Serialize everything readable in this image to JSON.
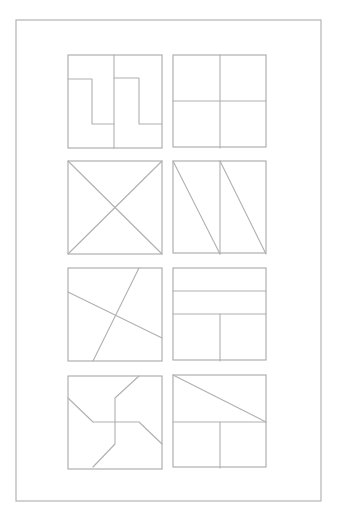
{
  "page": {
    "frame": {
      "x": 16,
      "y": 20,
      "w": 305,
      "h": 481
    },
    "line_color": "#aaaaaa"
  },
  "squares": [
    {
      "id": 1,
      "name": "two-step-shapes",
      "x": 68,
      "y": 55,
      "size": 94,
      "lines": [
        "M114,55 L114,148",
        "M68,79 L92,79 L92,124 L114,124",
        "M114,78 L139,78 L139,124 L162,124"
      ]
    },
    {
      "id": 2,
      "name": "four-quadrants",
      "x": 173,
      "y": 55,
      "size": 93,
      "lines": [
        "M220,55 L220,148",
        "M173,101 L266,101"
      ]
    },
    {
      "id": 3,
      "name": "diagonal-cross",
      "x": 68,
      "y": 161,
      "size": 94,
      "lines": [
        "M68,161 L162,254",
        "M162,161 L68,254"
      ]
    },
    {
      "id": 4,
      "name": "two-halves-diagonals",
      "x": 173,
      "y": 161,
      "size": 93,
      "lines": [
        "M220,161 L220,254",
        "M173,161 L220,254",
        "M220,161 L266,254"
      ]
    },
    {
      "id": 5,
      "name": "skewed-cross",
      "x": 68,
      "y": 268,
      "size": 94,
      "lines": [
        "M68,292 L162,338",
        "M139,268 L93,361"
      ]
    },
    {
      "id": 6,
      "name": "strips-and-squares",
      "x": 173,
      "y": 268,
      "size": 93,
      "lines": [
        "M173,291 L266,291",
        "M173,314 L266,314",
        "M220,314 L220,361"
      ]
    },
    {
      "id": 7,
      "name": "pinwheel",
      "x": 68,
      "y": 376,
      "size": 94,
      "lines": [
        "M68,398 L93,422 L139,422 L162,444",
        "M139,376 L115,398 L115,444 L93,467"
      ]
    },
    {
      "id": 8,
      "name": "triangle-and-squares",
      "x": 173,
      "y": 375,
      "size": 93,
      "lines": [
        "M173,422 L266,422",
        "M173,375 L266,422",
        "M220,422 L220,468"
      ]
    }
  ]
}
